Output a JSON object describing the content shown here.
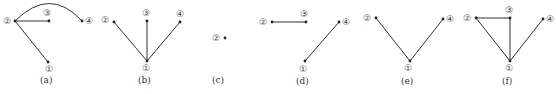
{
  "figure": {
    "panels": [
      {
        "id": "a",
        "caption": "(a)",
        "nodes": [
          {
            "id": "1",
            "label": "①"
          },
          {
            "id": "2",
            "label": "②"
          },
          {
            "id": "3",
            "label": "③"
          },
          {
            "id": "4",
            "label": "④"
          }
        ],
        "edges": [
          [
            "2",
            "3"
          ],
          [
            "2",
            "1"
          ],
          [
            "2",
            "4"
          ]
        ]
      },
      {
        "id": "b",
        "caption": "(b)",
        "nodes": [
          {
            "id": "1",
            "label": "①"
          },
          {
            "id": "2",
            "label": "②"
          },
          {
            "id": "3",
            "label": "③"
          },
          {
            "id": "4",
            "label": "④"
          }
        ],
        "edges": [
          [
            "1",
            "2"
          ],
          [
            "1",
            "3"
          ],
          [
            "1",
            "4"
          ]
        ]
      },
      {
        "id": "c",
        "caption": "(c)",
        "nodes": [
          {
            "id": "2",
            "label": "②"
          }
        ],
        "edges": []
      },
      {
        "id": "d",
        "caption": "(d)",
        "nodes": [
          {
            "id": "1",
            "label": "①"
          },
          {
            "id": "2",
            "label": "②"
          },
          {
            "id": "3",
            "label": "③"
          },
          {
            "id": "4",
            "label": "④"
          }
        ],
        "edges": [
          [
            "2",
            "3"
          ],
          [
            "1",
            "4"
          ]
        ]
      },
      {
        "id": "e",
        "caption": "(e)",
        "nodes": [
          {
            "id": "1",
            "label": "①"
          },
          {
            "id": "2",
            "label": "②"
          },
          {
            "id": "4",
            "label": "④"
          }
        ],
        "edges": [
          [
            "1",
            "2"
          ],
          [
            "1",
            "4"
          ]
        ]
      },
      {
        "id": "f",
        "caption": "(f)",
        "nodes": [
          {
            "id": "1",
            "label": "①"
          },
          {
            "id": "2",
            "label": "②"
          },
          {
            "id": "3",
            "label": "③"
          },
          {
            "id": "4",
            "label": "④"
          }
        ],
        "edges": [
          [
            "2",
            "3"
          ],
          [
            "1",
            "2"
          ],
          [
            "1",
            "3"
          ],
          [
            "1",
            "4"
          ]
        ]
      }
    ]
  }
}
